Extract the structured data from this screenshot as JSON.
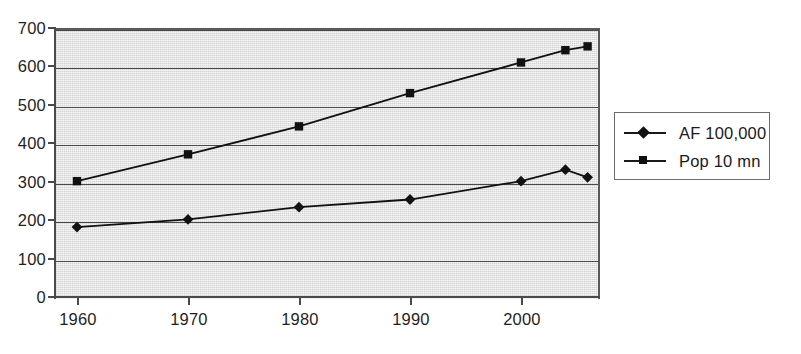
{
  "chart_data": {
    "type": "line",
    "title": "",
    "subtitle": "",
    "xlabel": "",
    "ylabel": "",
    "xlim": [
      1960,
      2006
    ],
    "ylim": [
      0,
      700
    ],
    "grid": true,
    "legend_position": "right",
    "x_ticks": [
      "1960",
      "1970",
      "1980",
      "1990",
      "2000"
    ],
    "x_tick_values": [
      1960,
      1970,
      1980,
      1990,
      2000
    ],
    "y_ticks": [
      "0",
      "100",
      "200",
      "300",
      "400",
      "500",
      "600",
      "700"
    ],
    "y_tick_values": [
      0,
      100,
      200,
      300,
      400,
      500,
      600,
      700
    ],
    "x": [
      1960,
      1970,
      1980,
      1990,
      2000,
      2004,
      2006
    ],
    "series": [
      {
        "name": "AF 100,000",
        "marker": "diamond",
        "color": "#111111",
        "values": [
          180,
          200,
          232,
          252,
          300,
          330,
          310
        ]
      },
      {
        "name": "Pop 10 mn",
        "marker": "square",
        "color": "#111111",
        "values": [
          300,
          370,
          443,
          530,
          610,
          642,
          652
        ]
      }
    ]
  },
  "legend": {
    "entries": [
      {
        "label": "AF 100,000",
        "marker": "diamond-marker-icon"
      },
      {
        "label": "Pop 10 mn",
        "marker": "square-marker-icon"
      }
    ]
  },
  "colors": {
    "plot_background": "#d3d3d3",
    "axis": "#4a4a4a",
    "gridline": "#4a4a4a",
    "series_ink": "#111111",
    "page_background": "#ffffff",
    "legend_border": "#6d6d6d"
  }
}
